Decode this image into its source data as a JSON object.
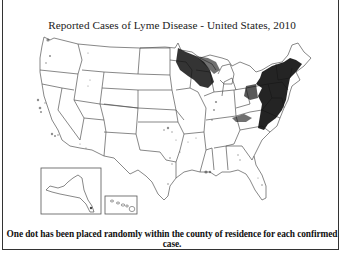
{
  "title": "Reported Cases of Lyme Disease - United States, 2010",
  "caption": "One dot has been placed randomly within the county of residence for each confirmed case.",
  "map": {
    "type": "dot-density choropleth",
    "region": "United States",
    "year": 2010,
    "insets": [
      "Alaska",
      "Hawaii"
    ],
    "dot_color": "#111111",
    "outline_color": "#555555",
    "high_density_regions": [
      "Northeast (Maine to Virginia)",
      "Upper Midwest (Minnesota, Wisconsin)"
    ],
    "low_density_regions": [
      "Pacific Coast (Northern California, Oregon, Washington)",
      "scattered South and Midwest"
    ]
  }
}
